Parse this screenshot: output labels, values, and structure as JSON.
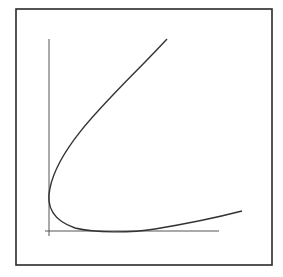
{
  "diagram": {
    "colors": {
      "background": "#ffffff",
      "frame": "#2a2a2a",
      "axes": "#555555",
      "curve": "#333333"
    },
    "frame": {
      "x": 16,
      "y": 9,
      "width": 256,
      "height": 256
    },
    "y_axis": {
      "x": 49,
      "y1": 39,
      "y2": 236
    },
    "x_axis": {
      "y": 231,
      "x1": 45,
      "x2": 219
    },
    "curve_path": "M 167 39 C 120 90, 60 140, 50 188 C 46 205, 52 220, 75 228 C 95 233, 130 233, 155 229 C 185 224, 215 218, 242 211",
    "labels": []
  }
}
